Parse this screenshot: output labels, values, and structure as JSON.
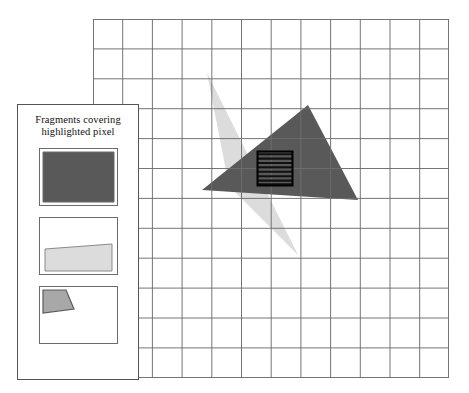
{
  "figure": {
    "background_color": "#ffffff"
  },
  "legend": {
    "caption_line_1": "Fragments covering",
    "caption_line_2": "highlighted pixel",
    "border_color": "#555555",
    "fragments": [
      {
        "name": "fragment-full-coverage",
        "shape": "rectangle",
        "fill": "#595959",
        "description": "dark triangle fully covers the pixel",
        "points": "3,3 74,3 74,53 3,53"
      },
      {
        "name": "fragment-partial-lower",
        "shape": "quadrilateral",
        "fill": "#dcdcdc",
        "description": "light triangle covers lower band of the pixel",
        "points": "5,31 72,26 72,53 5,53"
      },
      {
        "name": "fragment-partial-corner",
        "shape": "quadrilateral",
        "fill": "#a8a8a8",
        "description": "light triangle edge covers upper-left corner of the pixel",
        "points": "3,3 26,3 34,22 3,26"
      }
    ]
  },
  "grid": {
    "columns": 12,
    "rows": 12,
    "cell_size_px": 29.7,
    "line_color": "#6e6e6e",
    "outer_left": 93,
    "outer_top": 19,
    "width": 356,
    "height": 359
  },
  "shapes": {
    "dark_triangle": {
      "name": "dark-triangle",
      "fill": "#595959",
      "vertices": [
        [
          109,
          171
        ],
        [
          215,
          86
        ],
        [
          265,
          181
        ]
      ]
    },
    "light_triangle": {
      "name": "light-triangle",
      "fill": "#dcdcdc",
      "vertices": [
        [
          114,
          54
        ],
        [
          205,
          236
        ],
        [
          136,
          167
        ]
      ]
    },
    "highlighted_pixel": {
      "name": "highlighted-pixel",
      "x": 164,
      "y": 132,
      "width": 36,
      "height": 34,
      "border_color": "#000000",
      "stripe_color": "#111111",
      "stripe_count": 8
    }
  },
  "colors": {
    "dark_gray": "#595959",
    "light_gray": "#dcdcdc",
    "mid_gray": "#a8a8a8",
    "grid_line": "#6e6e6e",
    "panel_border": "#555555",
    "stripe": "#111111"
  }
}
